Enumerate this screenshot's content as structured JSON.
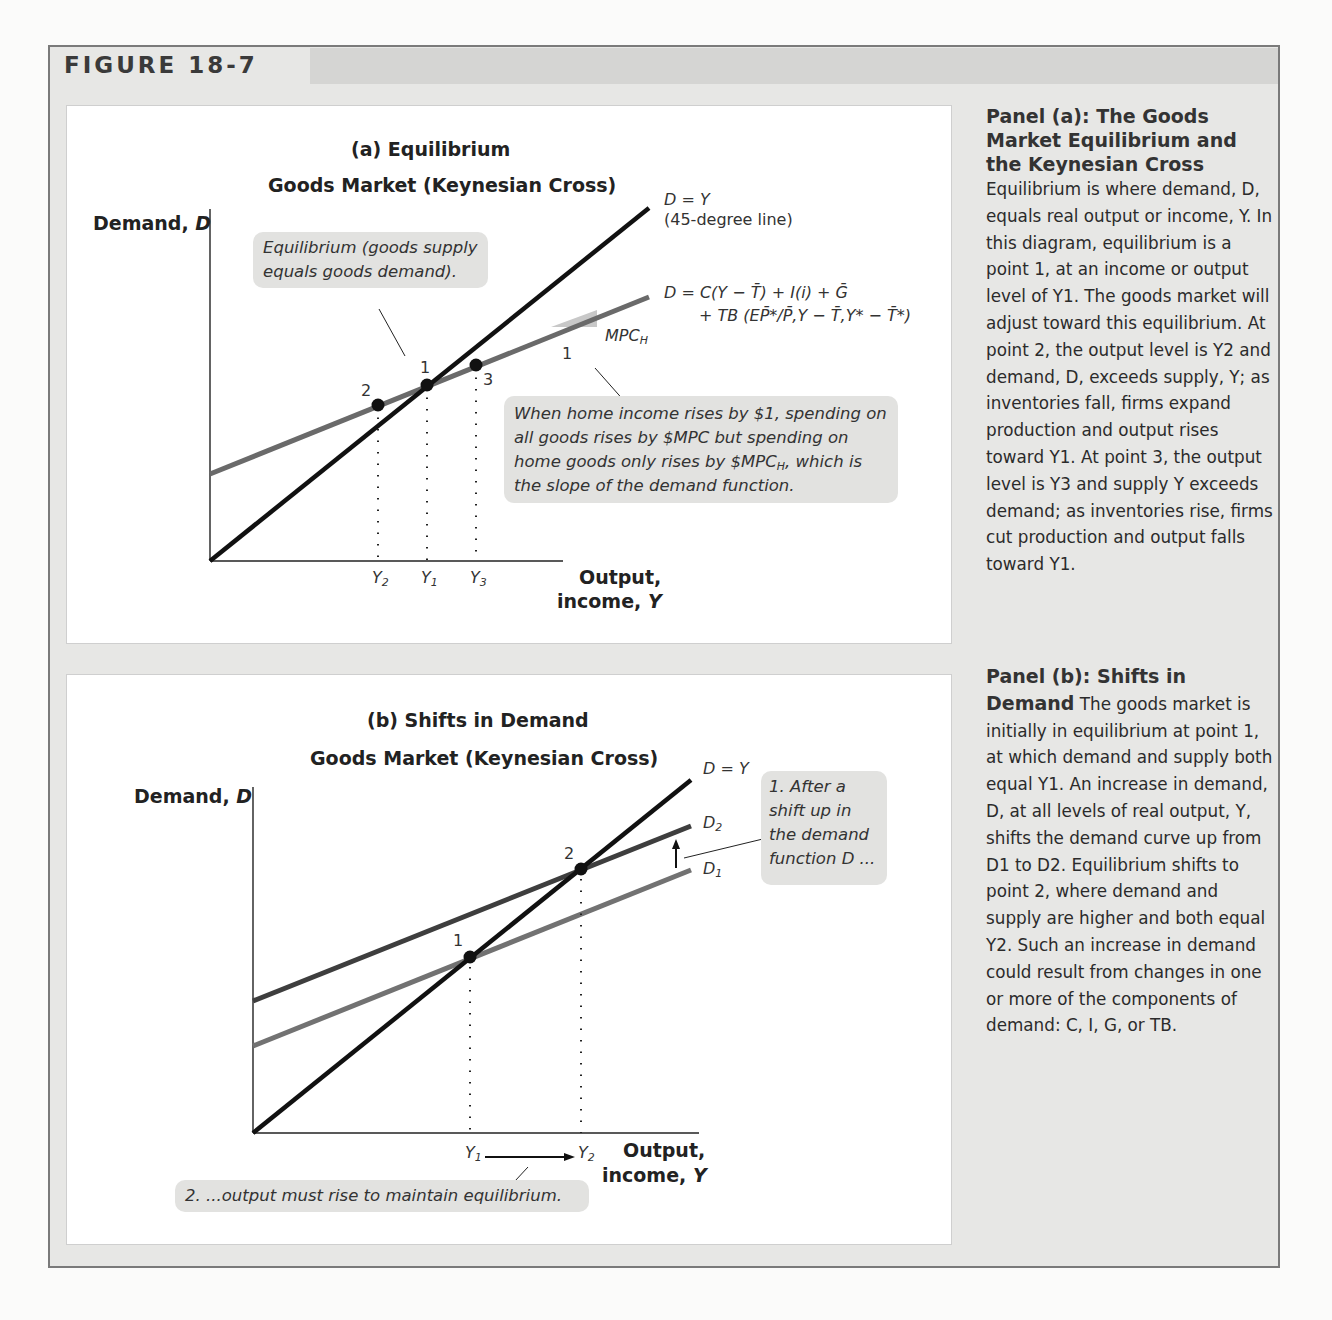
{
  "figure": {
    "label": "FIGURE 18-7"
  },
  "panel_a": {
    "title": "(a) Equilibrium",
    "subtitle": "Goods Market (Keynesian Cross)",
    "y_axis_label": "Demand, ",
    "y_axis_var": "D",
    "x_axis_label_line1": "Output,",
    "x_axis_label_line2": "income, ",
    "x_axis_var": "Y",
    "line_45_label": "D = Y",
    "line_45_sublabel": "(45-degree line)",
    "demand_eq_line1": "D = C(Y − T̄) + I(i) + Ḡ",
    "demand_eq_line2": "+ TB (EP̄*/P̄,Y − T̄,Y* − T̄*)",
    "slope_label": "MPC",
    "slope_label_sub": "H",
    "slope_run": "1",
    "points": [
      "1",
      "2",
      "3"
    ],
    "x_ticks": [
      {
        "base": "Y",
        "sub": "2"
      },
      {
        "base": "Y",
        "sub": "1"
      },
      {
        "base": "Y",
        "sub": "3"
      }
    ],
    "note_equilibrium": "Equilibrium (goods supply equals goods demand).",
    "note_slope_part1": "When home income rises by $1, spending on all goods rises by $MPC but spending on home goods only rises by $MPC",
    "note_slope_sub": "H",
    "note_slope_part2": ", which is the slope of the demand function."
  },
  "panel_b": {
    "title": "(b) Shifts in Demand",
    "subtitle": "Goods Market (Keynesian Cross)",
    "y_axis_label": "Demand, ",
    "y_axis_var": "D",
    "x_axis_label_line1": "Output,",
    "x_axis_label_line2": "income, ",
    "x_axis_var": "Y",
    "line_45_label": "D = Y",
    "d2_label": "D",
    "d2_sub": "2",
    "d1_label": "D",
    "d1_sub": "1",
    "points": [
      "1",
      "2"
    ],
    "x_ticks": [
      {
        "base": "Y",
        "sub": "1"
      },
      {
        "base": "Y",
        "sub": "2"
      }
    ],
    "note_shift": "1. After a shift up in the demand function D ...",
    "note_output": "2. ...output must rise to maintain equilibrium."
  },
  "sidebar": {
    "a_heading": "Panel (a): The Goods Market Equilibrium and the Keynesian Cross",
    "a_body": "Equilibrium is where demand, D, equals real output or income, Y. In this diagram, equilibrium is a point 1, at an income or output level of Y1. The goods market will adjust toward this equilibrium. At point 2, the output level is Y2 and demand, D, exceeds supply, Y; as inventories fall, firms expand production and output rises toward Y1. At point 3, the output level is Y3 and supply Y exceeds demand; as inventories rise, firms cut production and output falls toward Y1.",
    "b_heading": "Panel (b): Shifts in Demand",
    "b_body": "The goods market is initially in equilibrium at point 1, at which demand and supply both equal Y1. An increase in demand, D, at all levels of real output, Y, shifts the demand curve up from D1 to D2. Equilibrium shifts to point 2, where demand and supply are higher and both equal Y2. Such an increase in demand could result from changes in one or more of the components of demand: C, I, G, or TB."
  },
  "colors": {
    "frame_bg": "#e7e7e5",
    "header_bar": "#d5d5d3",
    "line_45": "#111111",
    "demand_a": "#6a6a6a",
    "d1": "#727272",
    "d2": "#3e3e3e",
    "note_bg": "#e2e2e0"
  }
}
